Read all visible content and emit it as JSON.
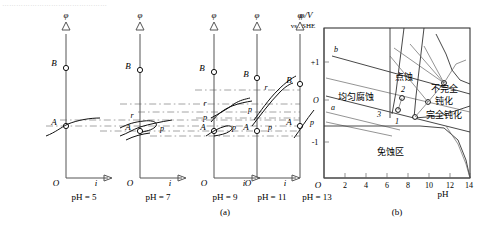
{
  "page": {
    "top_cut_text": "………………………………………"
  },
  "panel_a": {
    "caption": "(a)",
    "y_axis_symbol": "φ",
    "x_axis_symbol": "i",
    "origin_symbol": "O",
    "columns": [
      {
        "ph_label": "pH = 5",
        "point_labels": [
          "B",
          "A"
        ]
      },
      {
        "ph_label": "pH = 7",
        "point_labels": [
          "B",
          "r",
          "p",
          "A"
        ]
      },
      {
        "ph_label": "pH = 9",
        "point_labels": [
          "B",
          "r",
          "p",
          "A",
          "p"
        ]
      },
      {
        "ph_label": "pH = 11",
        "point_labels": [
          "B",
          "r",
          "p",
          "A",
          "p"
        ]
      },
      {
        "ph_label": "pH = 13",
        "point_labels": [
          "B",
          "A",
          "p"
        ]
      }
    ]
  },
  "panel_b": {
    "caption": "(b)",
    "y_axis_title_line1": "φ/V",
    "y_axis_title_line2": "vs . SHE",
    "x_axis_title": "pH",
    "origin_symbol": "O",
    "y_ticks": [
      "+1",
      "O",
      "-1"
    ],
    "x_ticks": [
      "2",
      "4",
      "6",
      "8",
      "10",
      "12",
      "14"
    ],
    "line_labels": [
      "b",
      "a",
      "1",
      "2",
      "3"
    ],
    "zones": [
      {
        "name": "uniform-corrosion",
        "label": "均匀腐蚀"
      },
      {
        "name": "pitting",
        "label": "点蚀"
      },
      {
        "name": "incomplete-passivation",
        "label_line1": "不完全",
        "label_line2": "钝化"
      },
      {
        "name": "complete-passivation",
        "label": "完全钝化"
      },
      {
        "name": "immunity",
        "label": "免蚀区"
      }
    ]
  },
  "colors": {
    "ink": "#111111",
    "axis": "#555555",
    "dash": "#9a9a9a"
  }
}
